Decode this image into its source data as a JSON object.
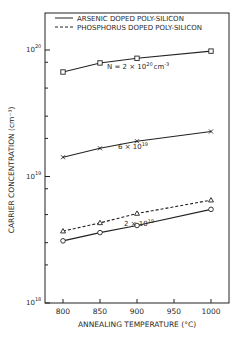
{
  "chart_data": {
    "type": "line",
    "title": "",
    "xlabel": "ANNEALING TEMPERATURE (°C)",
    "ylabel": "CARRIER CONCENTRATION (cm⁻³)",
    "x": [
      800,
      850,
      900,
      1000
    ],
    "xticks": [
      800,
      850,
      900,
      950,
      1000
    ],
    "xlim": [
      775,
      1025
    ],
    "yscale": "log",
    "ylim": [
      1e+18,
      2.3e+20
    ],
    "ytick_labels": [
      {
        "base": "10",
        "exp": "18",
        "value": 1e+18
      },
      {
        "base": "10",
        "exp": "19",
        "value": 1e+19
      },
      {
        "base": "10",
        "exp": "20",
        "value": 1e+20
      }
    ],
    "grid": false,
    "legend": {
      "position": "top-left inside",
      "entries": [
        {
          "label": "ARSENIC DOPED POLY-SILICON",
          "style": "solid"
        },
        {
          "label": "PHOSPHORUS DOPED POLY-SILICON",
          "style": "dashed"
        }
      ]
    },
    "series": [
      {
        "name": "Arsenic N = 2×10^20 cm^-3",
        "dopant": "arsenic",
        "style": "solid",
        "marker": "square",
        "values": [
          6.7e+19,
          7.9e+19,
          8.6e+19,
          9.8e+19
        ]
      },
      {
        "name": "Arsenic N = 6×10^19",
        "dopant": "arsenic",
        "style": "solid",
        "marker": "cross",
        "values": [
          1.42e+19,
          1.67e+19,
          1.9e+19,
          2.27e+19
        ]
      },
      {
        "name": "Phosphorus N = 2×10^19",
        "dopant": "phosphorus",
        "style": "dashed",
        "marker": "triangle",
        "values": [
          3.7e+18,
          4.3e+18,
          5.1e+18,
          6.5e+18
        ]
      },
      {
        "name": "Arsenic N = 2×10^19",
        "dopant": "arsenic",
        "style": "solid",
        "marker": "circle",
        "values": [
          3.1e+18,
          3.6e+18,
          4.1e+18,
          5.5e+18
        ]
      }
    ],
    "annotations": [
      {
        "text_pre": "N = 2 × 10",
        "sup": "20",
        "text_post": "cm",
        "sup2": "-3",
        "near_series": 0
      },
      {
        "text_pre": "6 × 10",
        "sup": "19",
        "near_series": 1
      },
      {
        "text_pre": "2 × 10",
        "sup": "19",
        "near_series": 3
      }
    ]
  }
}
